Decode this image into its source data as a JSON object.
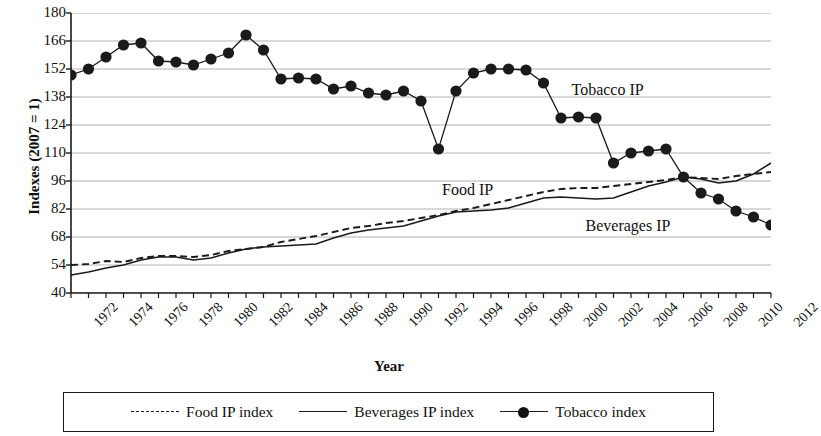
{
  "chart_data": {
    "type": "line",
    "title": "",
    "xlabel": "Year",
    "ylabel": "Indexes (2007 = 1)",
    "xlim": [
      1972,
      2012
    ],
    "ylim": [
      40,
      180
    ],
    "yticks": [
      180,
      166,
      152,
      138,
      124,
      110,
      96,
      82,
      68,
      54,
      40
    ],
    "xticks": [
      1972,
      1974,
      1976,
      1978,
      1980,
      1982,
      1984,
      1986,
      1988,
      1990,
      1992,
      1994,
      1996,
      1998,
      2000,
      2002,
      2004,
      2006,
      2008,
      2010,
      2012
    ],
    "grid": true,
    "legend_position": "bottom",
    "x": [
      1972,
      1973,
      1974,
      1975,
      1976,
      1977,
      1978,
      1979,
      1980,
      1981,
      1982,
      1983,
      1984,
      1985,
      1986,
      1987,
      1988,
      1989,
      1990,
      1991,
      1992,
      1993,
      1994,
      1995,
      1996,
      1997,
      1998,
      1999,
      2000,
      2001,
      2002,
      2003,
      2004,
      2005,
      2006,
      2007,
      2008,
      2009,
      2010,
      2011,
      2012
    ],
    "series": [
      {
        "name": "Food IP index",
        "style": "dashed",
        "marker": "none",
        "values": [
          54,
          54.5,
          56,
          55.5,
          57.5,
          58.5,
          58.5,
          58,
          59,
          61,
          62,
          63,
          65.5,
          67,
          68.5,
          70.5,
          72.5,
          73.5,
          75,
          76,
          77.5,
          79,
          81,
          82.5,
          84.5,
          86.5,
          88.5,
          90.5,
          92,
          92.5,
          92.5,
          93.5,
          94.5,
          95.5,
          96.5,
          98,
          97.5,
          97,
          98.5,
          99.5,
          100.5
        ]
      },
      {
        "name": "Beverages IP index",
        "style": "solid",
        "marker": "none",
        "values": [
          49,
          50.5,
          52.5,
          54,
          56.5,
          58,
          58,
          56.5,
          57.5,
          60,
          62,
          63,
          63.5,
          64,
          64.5,
          67.5,
          70,
          71.5,
          72.5,
          73.5,
          76,
          78.5,
          80.5,
          81,
          81.5,
          82.5,
          85,
          87.5,
          88,
          87.5,
          87,
          87.5,
          90.5,
          93.5,
          95.5,
          98,
          97,
          95,
          96,
          99.5,
          105
        ]
      },
      {
        "name": "Tobacco index",
        "style": "solid",
        "marker": "circle",
        "values": [
          149,
          152,
          158,
          164,
          165,
          156,
          155.5,
          154,
          157,
          160,
          169,
          161.5,
          147,
          147.5,
          147,
          142,
          143.5,
          140,
          139,
          141,
          136,
          112,
          141,
          150,
          152,
          152,
          151.5,
          145,
          127.5,
          128,
          127.5,
          105,
          110,
          111,
          112,
          98,
          90,
          87,
          81,
          78,
          74
        ]
      }
    ],
    "annotations": [
      {
        "text": "Tobacco IP",
        "x": 2000.6,
        "y": 141
      },
      {
        "text": "Food IP",
        "x": 1993.2,
        "y": 91
      },
      {
        "text": "Beverages IP",
        "x": 2001.4,
        "y": 73
      }
    ],
    "colors": {
      "line": "#1a1a1a",
      "grid": "#a9a9a9",
      "axis": "#1a1a1a",
      "background": "#ffffff"
    }
  },
  "legend": {
    "items": [
      {
        "label": "Food IP index",
        "style": "dashed",
        "marker": "none"
      },
      {
        "label": "Beverages IP index",
        "style": "solid",
        "marker": "none"
      },
      {
        "label": "Tobacco index",
        "style": "solid",
        "marker": "circle"
      }
    ]
  }
}
